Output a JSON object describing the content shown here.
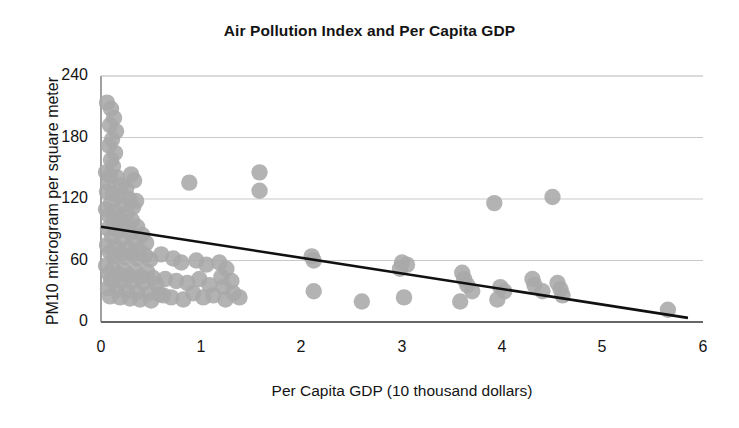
{
  "chart_data": {
    "type": "scatter",
    "title": "Air Pollution Index and Per Capita GDP",
    "xlabel": "Per Capita GDP (10 thousand dollars)",
    "ylabel": "PM10  microgram per square meter",
    "xlim": [
      0,
      6
    ],
    "ylim": [
      0,
      240
    ],
    "xticks": [
      0,
      1,
      2,
      3,
      4,
      5,
      6
    ],
    "yticks": [
      0,
      60,
      120,
      180,
      240
    ],
    "grid": "horizontal",
    "legend": "none",
    "marker_color": "#a8a8a8",
    "trendline_color": "#111111",
    "axis_color": "#888888",
    "series": [
      {
        "name": "Cities",
        "points": [
          [
            0.06,
            214
          ],
          [
            0.1,
            208
          ],
          [
            0.13,
            199
          ],
          [
            0.09,
            192
          ],
          [
            0.15,
            186
          ],
          [
            0.11,
            178
          ],
          [
            0.08,
            172
          ],
          [
            0.14,
            165
          ],
          [
            0.1,
            158
          ],
          [
            0.12,
            152
          ],
          [
            0.05,
            146
          ],
          [
            0.09,
            143
          ],
          [
            0.16,
            141
          ],
          [
            0.3,
            144
          ],
          [
            0.33,
            138
          ],
          [
            0.07,
            136
          ],
          [
            0.2,
            133
          ],
          [
            0.25,
            130
          ],
          [
            0.88,
            136
          ],
          [
            1.58,
            146
          ],
          [
            1.58,
            128
          ],
          [
            0.06,
            127
          ],
          [
            0.12,
            125
          ],
          [
            0.18,
            123
          ],
          [
            0.28,
            120
          ],
          [
            0.35,
            118
          ],
          [
            0.1,
            116
          ],
          [
            0.22,
            114
          ],
          [
            0.32,
            112
          ],
          [
            3.92,
            116
          ],
          [
            4.5,
            122
          ],
          [
            0.05,
            110
          ],
          [
            0.14,
            108
          ],
          [
            0.26,
            106
          ],
          [
            0.08,
            104
          ],
          [
            0.19,
            101
          ],
          [
            0.31,
            99
          ],
          [
            0.12,
            97
          ],
          [
            0.24,
            95
          ],
          [
            0.36,
            93
          ],
          [
            0.07,
            91
          ],
          [
            0.17,
            89
          ],
          [
            0.29,
            87
          ],
          [
            0.41,
            85
          ],
          [
            0.11,
            83
          ],
          [
            0.21,
            81
          ],
          [
            0.33,
            79
          ],
          [
            0.45,
            77
          ],
          [
            0.06,
            75
          ],
          [
            0.15,
            73
          ],
          [
            0.27,
            72
          ],
          [
            0.38,
            70
          ],
          [
            0.09,
            68
          ],
          [
            0.2,
            67
          ],
          [
            0.32,
            66
          ],
          [
            0.44,
            65
          ],
          [
            0.13,
            64
          ],
          [
            0.25,
            63
          ],
          [
            0.37,
            62
          ],
          [
            0.49,
            61
          ],
          [
            0.6,
            66
          ],
          [
            0.72,
            62
          ],
          [
            0.8,
            58
          ],
          [
            0.95,
            60
          ],
          [
            1.05,
            56
          ],
          [
            1.18,
            58
          ],
          [
            1.25,
            52
          ],
          [
            2.1,
            64
          ],
          [
            2.12,
            60
          ],
          [
            3.0,
            58
          ],
          [
            3.05,
            56
          ],
          [
            2.98,
            52
          ],
          [
            0.05,
            55
          ],
          [
            0.12,
            53
          ],
          [
            0.22,
            51
          ],
          [
            0.34,
            50
          ],
          [
            0.46,
            49
          ],
          [
            0.08,
            47
          ],
          [
            0.18,
            46
          ],
          [
            0.28,
            45
          ],
          [
            0.4,
            44
          ],
          [
            0.52,
            43
          ],
          [
            0.1,
            41
          ],
          [
            0.2,
            40
          ],
          [
            0.3,
            39
          ],
          [
            0.42,
            38
          ],
          [
            0.55,
            37
          ],
          [
            0.64,
            42
          ],
          [
            0.75,
            40
          ],
          [
            0.86,
            38
          ],
          [
            0.98,
            42
          ],
          [
            1.08,
            36
          ],
          [
            1.2,
            44
          ],
          [
            1.3,
            40
          ],
          [
            1.22,
            34
          ],
          [
            3.6,
            48
          ],
          [
            3.62,
            42
          ],
          [
            3.65,
            36
          ],
          [
            3.7,
            30
          ],
          [
            3.98,
            34
          ],
          [
            4.02,
            30
          ],
          [
            4.3,
            42
          ],
          [
            4.32,
            36
          ],
          [
            4.4,
            30
          ],
          [
            4.55,
            38
          ],
          [
            4.58,
            32
          ],
          [
            4.6,
            26
          ],
          [
            0.07,
            33
          ],
          [
            0.16,
            31
          ],
          [
            0.26,
            30
          ],
          [
            0.36,
            29
          ],
          [
            0.48,
            28
          ],
          [
            0.58,
            27
          ],
          [
            0.09,
            25
          ],
          [
            0.19,
            24
          ],
          [
            0.29,
            23
          ],
          [
            0.39,
            22
          ],
          [
            0.5,
            21
          ],
          [
            0.62,
            26
          ],
          [
            0.7,
            24
          ],
          [
            0.82,
            22
          ],
          [
            0.92,
            28
          ],
          [
            1.02,
            24
          ],
          [
            1.12,
            26
          ],
          [
            1.24,
            22
          ],
          [
            1.32,
            28
          ],
          [
            1.38,
            24
          ],
          [
            2.12,
            30
          ],
          [
            2.6,
            20
          ],
          [
            3.02,
            24
          ],
          [
            3.58,
            20
          ],
          [
            3.95,
            22
          ],
          [
            5.65,
            12
          ]
        ]
      }
    ],
    "trendline": {
      "name": "Linear fit",
      "x": [
        0.0,
        5.85
      ],
      "y": [
        93,
        4
      ]
    }
  }
}
